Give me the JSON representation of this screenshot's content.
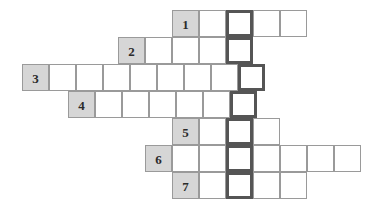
{
  "puzzle": {
    "type": "crossword-skeleton",
    "title": "",
    "cell_size": 27,
    "origin": {
      "x": 22,
      "y": 10
    },
    "colors": {
      "grid_line": "#9a9a9a",
      "cell_fill": "#ffffff",
      "numbered_fill": "#d6d6d6",
      "key_column_border": "#555555",
      "number_text": "#2b2b2b",
      "background": "#ffffff"
    },
    "key_column": {
      "name": "key-column",
      "column_index": 8,
      "x": 222,
      "width": 27,
      "highlighted": true
    },
    "rows": [
      {
        "number": "1",
        "start_x": 172,
        "y": 10,
        "length": 5,
        "key_cell_index": 2,
        "cells": [
          "1",
          "",
          "",
          "",
          ""
        ]
      },
      {
        "number": "2",
        "start_x": 118,
        "y": 37,
        "length": 5,
        "key_cell_index": 4,
        "cells": [
          "2",
          "",
          "",
          "",
          ""
        ]
      },
      {
        "number": "3",
        "start_x": 22,
        "y": 64,
        "length": 9,
        "key_cell_index": 8,
        "cells": [
          "3",
          "",
          "",
          "",
          "",
          "",
          "",
          "",
          ""
        ]
      },
      {
        "number": "4",
        "start_x": 68,
        "y": 91,
        "length": 7,
        "key_cell_index": 6,
        "cells": [
          "4",
          "",
          "",
          "",
          "",
          "",
          ""
        ]
      },
      {
        "number": "5",
        "start_x": 172,
        "y": 118,
        "length": 4,
        "key_cell_index": 2,
        "cells": [
          "5",
          "",
          "",
          ""
        ]
      },
      {
        "number": "6",
        "start_x": 145,
        "y": 145,
        "length": 8,
        "key_cell_index": 3,
        "cells": [
          "6",
          "",
          "",
          "",
          "",
          "",
          "",
          ""
        ]
      },
      {
        "number": "7",
        "start_x": 172,
        "y": 172,
        "length": 5,
        "key_cell_index": 2,
        "cells": [
          "7",
          "",
          "",
          "",
          ""
        ]
      }
    ]
  }
}
